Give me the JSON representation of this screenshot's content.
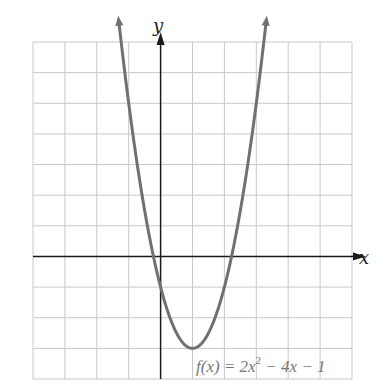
{
  "chart_data": {
    "type": "line",
    "title": "",
    "function_label": "f(x) = 2x² − 4x − 1",
    "function": {
      "a": 2,
      "b": -4,
      "c": -1
    },
    "xlabel": "x",
    "ylabel": "y",
    "xlim": [
      -4,
      6
    ],
    "ylim": [
      -4,
      7
    ],
    "grid": true,
    "grid_step": 1,
    "legend": null,
    "key_points": {
      "vertex": [
        1,
        -3
      ],
      "y_intercept": [
        0,
        -1
      ],
      "x_intercepts": [
        -0.22,
        2.22
      ]
    },
    "series": [
      {
        "name": "f(x) = 2x² − 4x − 1",
        "x": [
          -1.25,
          -1,
          -0.5,
          0,
          0.5,
          1,
          1.5,
          2,
          2.5,
          3,
          3.25
        ],
        "y": [
          7.13,
          5,
          2,
          -1,
          -2.5,
          -3,
          -2.5,
          -1,
          1.5,
          5,
          7.13
        ],
        "color": "#707070"
      }
    ]
  },
  "labels": {
    "x_axis": "x",
    "y_axis": "y",
    "equation_prefix": "f(x) = 2x",
    "equation_exp": "2",
    "equation_suffix": " − 4x − 1"
  },
  "colors": {
    "grid": "#c8c8c8",
    "axis": "#1a1a1a",
    "curve": "#707070",
    "equation": "#777777"
  }
}
